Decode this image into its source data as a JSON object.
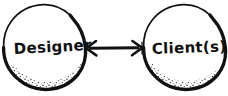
{
  "diagram": {
    "style": "hand-drawn ink sketch",
    "background_color": "#ffffff",
    "ink_color": "#111111",
    "nodes": [
      {
        "id": "designer",
        "label": "Designer",
        "shape": "circle",
        "cx": 44,
        "cy": 48,
        "r": 41,
        "shading": "stippled lower-right"
      },
      {
        "id": "clients",
        "label": "Client(s)",
        "shape": "circle",
        "cx": 184,
        "cy": 48,
        "r": 41,
        "shading": "stippled lower-right"
      }
    ],
    "connectors": [
      {
        "id": "designer-clients-link",
        "from": "designer",
        "to": "clients",
        "type": "double-headed-arrow",
        "orientation": "horizontal",
        "x1": 86,
        "x2": 142,
        "y": 48,
        "label": ""
      }
    ]
  }
}
